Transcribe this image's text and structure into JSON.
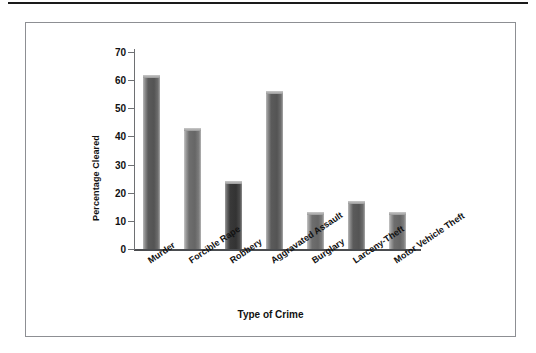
{
  "figure": {
    "frame_border_color": "#8d8f93",
    "background": "#ffffff",
    "rule_color": "#1a1a1a"
  },
  "chart_data": {
    "type": "bar",
    "title": "",
    "subtitle": "",
    "xlabel": "Type of Crime",
    "ylabel": "Percentage Cleared",
    "categories": [
      "Murder",
      "Forcible Rape",
      "Robbery",
      "Aggravated Assault",
      "Burglary",
      "Larceny-Theft",
      "Motor Vehicle Theft"
    ],
    "values": [
      62,
      43,
      24,
      56,
      13,
      17,
      13
    ],
    "bar_shades": [
      "medium",
      "light",
      "dark",
      "medium",
      "light",
      "medium",
      "light"
    ],
    "ylim": [
      0,
      70
    ],
    "ytick_values": [
      0,
      10,
      20,
      30,
      40,
      50,
      60,
      70
    ],
    "ytick_labels": [
      "0",
      "10",
      "20",
      "30",
      "40",
      "50",
      "60",
      "70"
    ],
    "grid": false,
    "legend": "none",
    "bar_color_medium": "#545454",
    "bar_color_dark": "#333333",
    "bar_color_light": "#666666",
    "axis_color": "#4a4c4f"
  }
}
